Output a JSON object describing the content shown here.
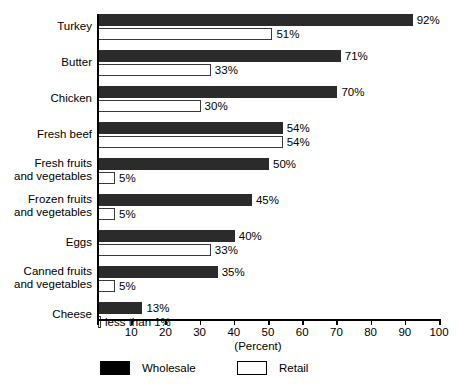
{
  "chart_data": {
    "type": "bar",
    "orientation": "horizontal",
    "title": "",
    "xlabel": "(Percent)",
    "ylabel": "",
    "xlim": [
      0,
      100
    ],
    "grid": false,
    "legend_position": "bottom",
    "categories": [
      "Turkey",
      "Butter",
      "Chicken",
      "Fresh beef",
      "Fresh fruits\nand vegetables",
      "Frozen fruits\nand vegetables",
      "Eggs",
      "Canned fruits\nand vegetables",
      "Cheese"
    ],
    "xticks": [
      0,
      10,
      20,
      30,
      40,
      50,
      60,
      70,
      80,
      90,
      100
    ],
    "xtick_labels": [
      "",
      "10",
      "20",
      "30",
      "40",
      "50",
      "60",
      "70",
      "80",
      "90",
      "100"
    ],
    "series": [
      {
        "name": "Wholesale",
        "color": "#2b2b2b",
        "values": [
          92,
          71,
          70,
          54,
          50,
          45,
          40,
          35,
          13
        ],
        "labels": [
          "92%",
          "71%",
          "70%",
          "54%",
          "50%",
          "45%",
          "40%",
          "35%",
          "13%"
        ]
      },
      {
        "name": "Retail",
        "color": "#ffffff",
        "values": [
          51,
          33,
          30,
          54,
          5,
          5,
          33,
          5,
          0.5
        ],
        "labels": [
          "51%",
          "33%",
          "30%",
          "54%",
          "5%",
          "5%",
          "33%",
          "5%",
          "less than 1%"
        ]
      }
    ]
  },
  "legend": {
    "items": [
      {
        "label": "Wholesale",
        "swatch": "filled-black"
      },
      {
        "label": "Retail",
        "swatch": "outlined-white"
      }
    ]
  },
  "axis": {
    "x_title": "(Percent)"
  }
}
